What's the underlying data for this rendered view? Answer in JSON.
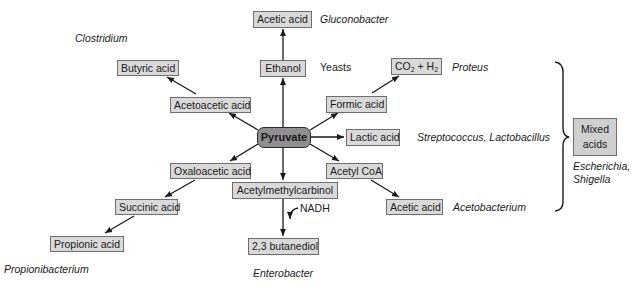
{
  "diagram": {
    "center": {
      "label": "Pyruvate"
    },
    "products": {
      "acetic_acid_top": "Acetic acid",
      "ethanol": "Ethanol",
      "butyric_acid": "Butyric acid",
      "acetoacetic_acid": "Acetoacetic acid",
      "co2": "CO",
      "co2_sub": "2",
      "plus_h": " + H",
      "h2_sub": "2",
      "formic_acid": "Formic acid",
      "lactic_acid": "Lactic acid",
      "oxaloacetic_acid": "Oxaloacetic acid",
      "succinic_acid": "Succinic acid",
      "propionic_acid": "Propionic acid",
      "acetylmethylcarbinol": "Acetylmethylcarbinol",
      "butanediol": "2,3 butanediol",
      "acetyl_coa": "Acetyl CoA",
      "acetic_acid_bottom": "Acetic acid",
      "mixed_acids_line1": "Mixed",
      "mixed_acids_line2": "acids"
    },
    "cofactor": {
      "nadh": "NADH"
    },
    "organisms": {
      "gluconobacter": "Gluconobacter",
      "clostridium": "Clostridium",
      "yeasts": "Yeasts",
      "proteus": "Proteus",
      "strep_lacto": "Streptococcus, Lactobacillus",
      "escherichia": "Escherichia,",
      "shigella": "Shigella",
      "acetobacterium": "Acetobacterium",
      "propionibacterium": "Propionibacterium",
      "enterobacter": "Enterobacter"
    },
    "colors": {
      "product_box": "#d9d9d9",
      "pyruvate_box": "#8f8f8f",
      "mixed_box": "#cfcfcf",
      "line": "#1a1a1a"
    }
  }
}
